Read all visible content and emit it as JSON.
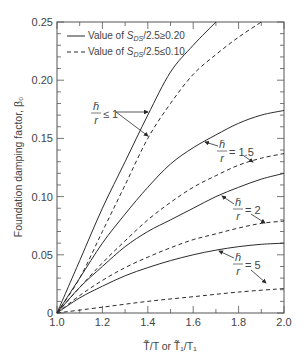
{
  "chart_data": {
    "type": "line",
    "title": "",
    "xlabel": "T̃/T or T̃₁/T₁",
    "ylabel": "Foundation damping factor, β₀",
    "xlim": [
      1.0,
      2.0
    ],
    "ylim": [
      0,
      0.25
    ],
    "x_ticks": [
      "1.0",
      "1.2",
      "1.4",
      "1.6",
      "1.8",
      "2.0"
    ],
    "y_ticks": [
      "0",
      "0.05",
      "0.10",
      "0.15",
      "0.20",
      "0.25"
    ],
    "grid": false,
    "legend_position": "upper-left",
    "legend": [
      {
        "style": "solid",
        "label_prefix": "Value of ",
        "label_var": "S",
        "label_sub": "DS",
        "label_suffix": "/2.5≥0.20"
      },
      {
        "style": "dashed",
        "label_prefix": "Value of ",
        "label_var": "S",
        "label_sub": "DS",
        "label_suffix": "/2.5≤0.10"
      }
    ],
    "series": [
      {
        "name": "h̄/r ≤ 1, SDS/2.5≥0.20",
        "style": "solid",
        "x": [
          1.0,
          1.1,
          1.2,
          1.3,
          1.4,
          1.5,
          1.6,
          1.7
        ],
        "values": [
          0,
          0.045,
          0.09,
          0.13,
          0.17,
          0.207,
          0.23,
          0.25
        ]
      },
      {
        "name": "h̄/r ≤ 1, SDS/2.5≤0.10",
        "style": "dashed",
        "x": [
          1.0,
          1.1,
          1.2,
          1.3,
          1.4,
          1.5,
          1.6,
          1.7,
          1.8,
          1.9
        ],
        "values": [
          0,
          0.03,
          0.07,
          0.11,
          0.15,
          0.18,
          0.205,
          0.222,
          0.237,
          0.25
        ]
      },
      {
        "name": "h̄/r = 1.5, SDS/2.5≥0.20",
        "style": "solid",
        "x": [
          1.0,
          1.1,
          1.2,
          1.3,
          1.4,
          1.5,
          1.6,
          1.7,
          1.8,
          1.9,
          2.0
        ],
        "values": [
          0,
          0.03,
          0.06,
          0.085,
          0.108,
          0.128,
          0.142,
          0.153,
          0.163,
          0.17,
          0.174
        ]
      },
      {
        "name": "h̄/r = 1.5, SDS/2.5≤0.10",
        "style": "dashed",
        "x": [
          1.0,
          1.1,
          1.2,
          1.3,
          1.4,
          1.5,
          1.6,
          1.7,
          1.8,
          1.9,
          2.0
        ],
        "values": [
          0,
          0.022,
          0.043,
          0.062,
          0.08,
          0.095,
          0.108,
          0.118,
          0.127,
          0.133,
          0.137
        ]
      },
      {
        "name": "h̄/r = 2, SDS/2.5≥0.20",
        "style": "solid",
        "x": [
          1.0,
          1.1,
          1.2,
          1.3,
          1.4,
          1.5,
          1.6,
          1.7,
          1.8,
          1.9,
          2.0
        ],
        "values": [
          0,
          0.022,
          0.04,
          0.057,
          0.07,
          0.08,
          0.09,
          0.1,
          0.108,
          0.115,
          0.12
        ]
      },
      {
        "name": "h̄/r = 2, SDS/2.5≤0.10",
        "style": "dashed",
        "x": [
          1.0,
          1.1,
          1.2,
          1.3,
          1.4,
          1.5,
          1.6,
          1.7,
          1.8,
          1.9,
          2.0
        ],
        "values": [
          0,
          0.015,
          0.028,
          0.039,
          0.048,
          0.056,
          0.063,
          0.068,
          0.073,
          0.077,
          0.079
        ]
      },
      {
        "name": "h̄/r = 5, SDS/2.5≥0.20",
        "style": "solid",
        "x": [
          1.0,
          1.1,
          1.2,
          1.3,
          1.4,
          1.5,
          1.6,
          1.7,
          1.8,
          1.9,
          2.0
        ],
        "values": [
          0,
          0.013,
          0.023,
          0.032,
          0.039,
          0.045,
          0.05,
          0.054,
          0.057,
          0.059,
          0.06
        ]
      },
      {
        "name": "h̄/r = 5, SDS/2.5≤0.10",
        "style": "dashed",
        "x": [
          1.0,
          1.2,
          1.4,
          1.6,
          1.8,
          2.0
        ],
        "values": [
          0,
          0.005,
          0.01,
          0.014,
          0.018,
          0.021
        ]
      }
    ],
    "annotations": [
      {
        "num": "h̄",
        "den": "r",
        "rel": "≤ 1",
        "targets": [
          "h̄/r ≤ 1 solid",
          "h̄/r ≤ 1 dashed"
        ]
      },
      {
        "num": "h̄",
        "den": "r",
        "rel": "= 1.5",
        "targets": [
          "h̄/r = 1.5 solid",
          "h̄/r = 1.5 dashed"
        ]
      },
      {
        "num": "h̄",
        "den": "r",
        "rel": "= 2",
        "targets": [
          "h̄/r = 2 solid",
          "h̄/r = 2 dashed"
        ]
      },
      {
        "num": "h̄",
        "den": "r",
        "rel": "= 5",
        "targets": [
          "h̄/r = 5 solid",
          "h̄/r = 5 dashed"
        ]
      }
    ]
  },
  "colors": {
    "line": "#2b2b2b",
    "axis": "#555555",
    "text": "#444444"
  }
}
